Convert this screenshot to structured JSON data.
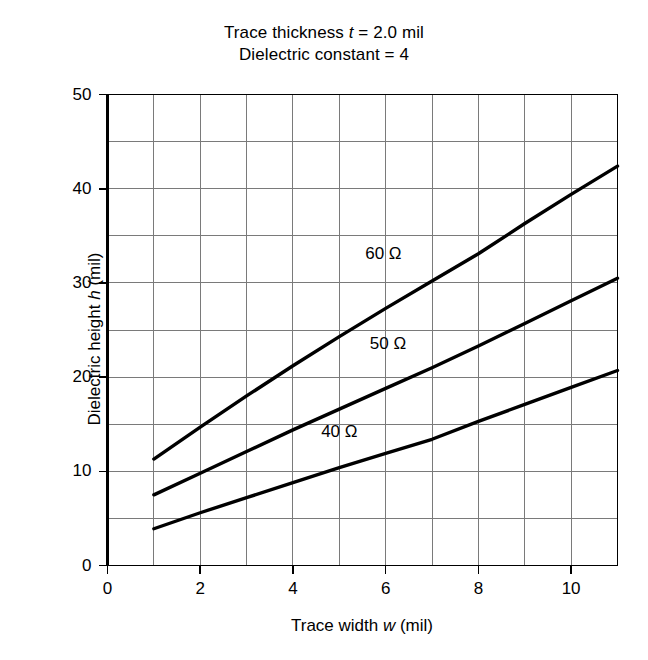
{
  "figure": {
    "title_lines": [
      {
        "pre": "Trace thickness ",
        "italic": "t",
        "post": " = 2.0 mil"
      },
      {
        "pre": "Dielectric constant = 4",
        "italic": "",
        "post": ""
      }
    ],
    "background_color": "#ffffff",
    "ink_color": "#000000",
    "grid_color": "#7a7a7a"
  },
  "chart_data": {
    "type": "line",
    "xlabel": "Trace width w (mil)",
    "ylabel": "Dielectric height h (mil)",
    "xlim": [
      0,
      11
    ],
    "ylim": [
      0,
      50
    ],
    "xticks": [
      0,
      2,
      4,
      6,
      8,
      10
    ],
    "xtick_labels": [
      "0",
      "2",
      "4",
      "6",
      "8",
      "10"
    ],
    "yticks": [
      0,
      10,
      20,
      30,
      40,
      50
    ],
    "ytick_labels": [
      "0",
      "10",
      "20",
      "30",
      "40",
      "50"
    ],
    "grid": true,
    "grid_x_step": 1,
    "grid_y_step": 5,
    "legend": "inline-annotations",
    "series": [
      {
        "name": "60 Ω",
        "label": "60 Ω",
        "label_at": {
          "x": 5.95,
          "y": 33.1
        },
        "x": [
          1,
          2,
          3,
          4,
          5,
          6,
          7,
          8,
          9,
          10,
          11
        ],
        "y": [
          11.3,
          14.7,
          18.0,
          21.2,
          24.3,
          27.3,
          30.2,
          33.1,
          36.3,
          39.4,
          42.4
        ]
      },
      {
        "name": "50 Ω",
        "label": "50 Ω",
        "label_at": {
          "x": 6.05,
          "y": 23.5
        },
        "x": [
          1,
          2,
          3,
          4,
          5,
          6,
          7,
          8,
          9,
          10,
          11
        ],
        "y": [
          7.5,
          9.8,
          12.1,
          14.4,
          16.6,
          18.8,
          21.0,
          23.3,
          25.7,
          28.1,
          30.5
        ]
      },
      {
        "name": "40 Ω",
        "label": "40 Ω",
        "label_at": {
          "x": 5.0,
          "y": 14.2
        },
        "x": [
          1,
          2,
          3,
          4,
          5,
          6,
          7,
          8,
          9,
          10,
          11
        ],
        "y": [
          3.9,
          5.6,
          7.2,
          8.8,
          10.4,
          11.9,
          13.4,
          15.3,
          17.1,
          18.9,
          20.7
        ]
      }
    ]
  }
}
